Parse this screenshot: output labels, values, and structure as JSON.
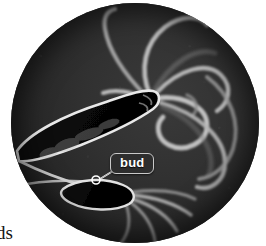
{
  "figure": {
    "kind": "photomicrograph",
    "field_shape": "circle",
    "palette": {
      "background": "#ffffff",
      "field_dark": "#2b2b2b",
      "field_mid": "#3a3a3a",
      "organism_body": "#0a0a0a",
      "organism_outline": "#e8e8e8",
      "tentacle": "#b9b9b9",
      "callout_fill": "#2e2e2e",
      "callout_border": "#c9c9c9",
      "callout_text": "#ffffff",
      "caption_text": "#141414"
    }
  },
  "annotations": {
    "bud": {
      "label": "bud",
      "leader_from": "callout-bottom-left",
      "leader_to": "bud-body",
      "marker": "small-open-circle"
    }
  },
  "caption": {
    "fragment": "ds"
  }
}
